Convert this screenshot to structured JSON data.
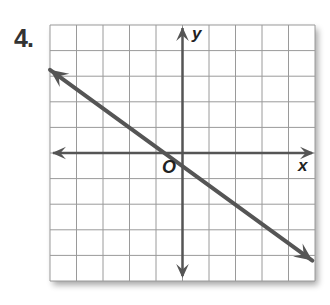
{
  "problem_number": "4.",
  "chart_data": {
    "type": "line",
    "title": "",
    "xlabel": "x",
    "ylabel": "y",
    "origin_label": "O",
    "xlim": [
      -5,
      5
    ],
    "ylim": [
      -5,
      5
    ],
    "grid": true,
    "grid_step": 1,
    "series": [
      {
        "name": "line",
        "equation": "y = -3/4 x - 1/2",
        "slope": -0.75,
        "y_intercept": -0.5,
        "x": [
          -5,
          4.9
        ],
        "y": [
          3.25,
          -4.2
        ],
        "arrows": "both",
        "color": "#555555"
      }
    ],
    "axes_color": "#555555",
    "grid_color": "#9a9a9a"
  }
}
